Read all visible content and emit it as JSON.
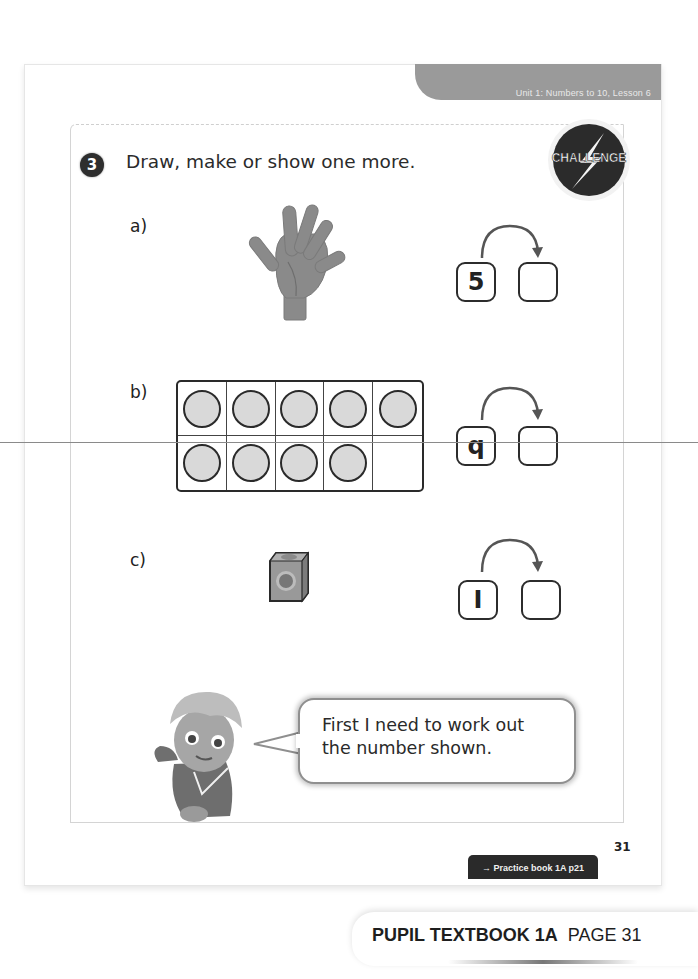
{
  "header": {
    "unit_lesson": "Unit 1: Numbers to 10, Lesson 6"
  },
  "question": {
    "number": "3",
    "prompt": "Draw, make or show one more.",
    "badge_label": "CHALLENGE"
  },
  "parts": [
    {
      "label": "a)",
      "picture": "hand-five-fingers",
      "start_value": "5",
      "answer_value": ""
    },
    {
      "label": "b)",
      "picture": "ten-frame",
      "ten_frame": {
        "rows": 2,
        "cols": 5,
        "filled": [
          true,
          true,
          true,
          true,
          true,
          true,
          true,
          true,
          true,
          false
        ]
      },
      "start_value": "9",
      "start_value_as_printed": "q",
      "answer_value": ""
    },
    {
      "label": "c)",
      "picture": "single-cube",
      "start_value": "1",
      "start_value_as_printed": "I",
      "answer_value": ""
    }
  ],
  "speech": {
    "line1": "First I need to work out",
    "line2": "the number shown."
  },
  "footer": {
    "page_number": "31",
    "practice_link": "→ Practice book 1A p21",
    "banner_bold": "PUPIL TEXTBOOK 1A",
    "banner_page": "PAGE 31"
  },
  "colors": {
    "tab_gray": "#9a9a9a",
    "ink": "#2a2a2a",
    "counter_fill": "#d9d9d9"
  }
}
